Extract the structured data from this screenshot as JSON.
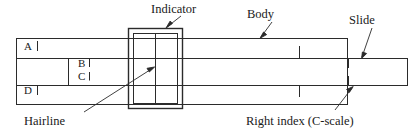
{
  "figure": {
    "type": "technical-line-diagram",
    "stroke_color": "#2b2b2b",
    "background_color": "#ffffff"
  },
  "callouts": [
    {
      "key": "indicator",
      "label": "Indicator",
      "x": 151,
      "y": 3,
      "leader": "down-left"
    },
    {
      "key": "body",
      "label": "Body",
      "x": 247,
      "y": 8,
      "leader": "down-left"
    },
    {
      "key": "slide",
      "label": "Slide",
      "x": 349,
      "y": 14,
      "leader": "down-left"
    },
    {
      "key": "hairline",
      "label": "Hairline",
      "x": 68,
      "y": 116,
      "leader": "up-right"
    },
    {
      "key": "right-index",
      "label": "Right index (C-scale)",
      "x": 255,
      "y": 116,
      "leader": "up-right"
    }
  ],
  "scale_labels": [
    {
      "key": "scale-a",
      "label": "A",
      "x": 24,
      "y": 45
    },
    {
      "key": "scale-b",
      "label": "B",
      "x": 78,
      "y": 62
    },
    {
      "key": "scale-c",
      "label": "C",
      "x": 78,
      "y": 75
    },
    {
      "key": "scale-d",
      "label": "D",
      "x": 24,
      "y": 88
    }
  ],
  "parts": {
    "body": {
      "name": "Body",
      "x": 16,
      "y": 38,
      "width": 332,
      "height": 67
    },
    "slide": {
      "name": "Slide",
      "x": 16,
      "y": 58,
      "width": 392,
      "height": 27
    },
    "indicator": {
      "name": "Indicator",
      "x": 128,
      "y": 28,
      "width": 54,
      "height": 80
    },
    "hairline": {
      "name": "Hairline",
      "x": 155,
      "y": 32,
      "height": 72
    }
  },
  "tick_marks": [
    {
      "key": "tick-a",
      "scale": "A",
      "x": 38,
      "y": 38,
      "length": 10
    },
    {
      "key": "tick-b",
      "scale": "B",
      "x": 90,
      "y": 58,
      "length": 9
    },
    {
      "key": "tick-c",
      "scale": "C",
      "x": 90,
      "y": 72,
      "length": 9
    },
    {
      "key": "tick-d",
      "scale": "D",
      "x": 38,
      "y": 80,
      "length": 10
    },
    {
      "key": "tick-body-upper",
      "scale": "A",
      "x": 300,
      "y": 46,
      "length": 12
    },
    {
      "key": "tick-body-lower",
      "scale": "D",
      "x": 300,
      "y": 85,
      "length": 12
    },
    {
      "key": "tick-slide-upper",
      "scale": "B",
      "x": 348,
      "y": 58,
      "length": 10
    },
    {
      "key": "tick-slide-lower",
      "scale": "C",
      "x": 348,
      "y": 75,
      "length": 10
    }
  ]
}
